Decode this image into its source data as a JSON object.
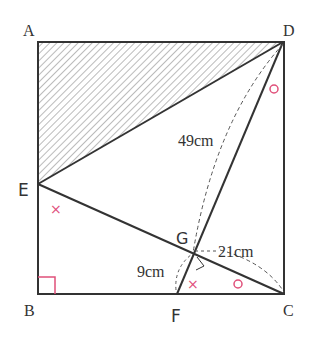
{
  "points": {
    "A": {
      "label": "A",
      "x": 38,
      "y": 42
    },
    "D": {
      "label": "D",
      "x": 283,
      "y": 42
    },
    "B": {
      "label": "B",
      "x": 38,
      "y": 294
    },
    "C": {
      "label": "C",
      "x": 284,
      "y": 294
    },
    "E": {
      "label": "E",
      "x": 38,
      "y": 184
    },
    "F": {
      "label": "F",
      "x": 177,
      "y": 294
    },
    "G": {
      "label": "G",
      "x": 193,
      "y": 253
    }
  },
  "measurements": {
    "DG": "49cm",
    "GC": "21cm",
    "FG": "9cm"
  },
  "marks": {
    "angle_x": "×",
    "angle_o": "○"
  },
  "colors": {
    "line": "#333333",
    "accent": "#e0507a",
    "hatch": "#666666"
  }
}
